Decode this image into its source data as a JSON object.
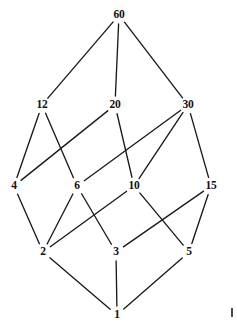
{
  "diagram": {
    "kind": "hasse-diagram",
    "background_color": "#ffffff",
    "line_color": "#1a1a1a",
    "label_color": "#111111",
    "nodes": [
      {
        "id": "n60",
        "label": "60",
        "x": 119,
        "y": 15,
        "rank": 0
      },
      {
        "id": "n12",
        "label": "12",
        "x": 42,
        "y": 105,
        "rank": 1
      },
      {
        "id": "n20",
        "label": "20",
        "x": 115,
        "y": 105,
        "rank": 1
      },
      {
        "id": "n30",
        "label": "30",
        "x": 188,
        "y": 105,
        "rank": 1
      },
      {
        "id": "n4",
        "label": "4",
        "x": 14,
        "y": 186,
        "rank": 2
      },
      {
        "id": "n6",
        "label": "6",
        "x": 77,
        "y": 186,
        "rank": 2
      },
      {
        "id": "n10",
        "label": "10",
        "x": 134,
        "y": 186,
        "rank": 2
      },
      {
        "id": "n15",
        "label": "15",
        "x": 211,
        "y": 186,
        "rank": 2
      },
      {
        "id": "n2",
        "label": "2",
        "x": 43,
        "y": 252,
        "rank": 3
      },
      {
        "id": "n3",
        "label": "3",
        "x": 116,
        "y": 252,
        "rank": 3
      },
      {
        "id": "n5",
        "label": "5",
        "x": 189,
        "y": 252,
        "rank": 3
      },
      {
        "id": "n1",
        "label": "1",
        "x": 117,
        "y": 315,
        "rank": 4
      }
    ],
    "edges": [
      {
        "from": "n60",
        "to": "n12"
      },
      {
        "from": "n60",
        "to": "n20"
      },
      {
        "from": "n60",
        "to": "n30"
      },
      {
        "from": "n12",
        "to": "n4"
      },
      {
        "from": "n12",
        "to": "n6"
      },
      {
        "from": "n20",
        "to": "n4"
      },
      {
        "from": "n20",
        "to": "n10"
      },
      {
        "from": "n30",
        "to": "n6"
      },
      {
        "from": "n30",
        "to": "n10"
      },
      {
        "from": "n30",
        "to": "n15"
      },
      {
        "from": "n4",
        "to": "n2"
      },
      {
        "from": "n6",
        "to": "n2"
      },
      {
        "from": "n6",
        "to": "n3"
      },
      {
        "from": "n10",
        "to": "n2"
      },
      {
        "from": "n10",
        "to": "n5"
      },
      {
        "from": "n15",
        "to": "n3"
      },
      {
        "from": "n15",
        "to": "n5"
      },
      {
        "from": "n2",
        "to": "n1"
      },
      {
        "from": "n3",
        "to": "n1"
      },
      {
        "from": "n5",
        "to": "n1"
      }
    ]
  },
  "chart_data": {
    "type": "diagram",
    "nodes": [
      "60",
      "12",
      "20",
      "30",
      "4",
      "6",
      "10",
      "15",
      "2",
      "3",
      "5",
      "1"
    ],
    "levels": [
      [
        "60"
      ],
      [
        "12",
        "20",
        "30"
      ],
      [
        "4",
        "6",
        "10",
        "15"
      ],
      [
        "2",
        "3",
        "5"
      ],
      [
        "1"
      ]
    ],
    "edges": [
      [
        "60",
        "12"
      ],
      [
        "60",
        "20"
      ],
      [
        "60",
        "30"
      ],
      [
        "12",
        "4"
      ],
      [
        "12",
        "6"
      ],
      [
        "20",
        "4"
      ],
      [
        "20",
        "10"
      ],
      [
        "30",
        "6"
      ],
      [
        "30",
        "10"
      ],
      [
        "30",
        "15"
      ],
      [
        "4",
        "2"
      ],
      [
        "6",
        "2"
      ],
      [
        "6",
        "3"
      ],
      [
        "10",
        "2"
      ],
      [
        "10",
        "5"
      ],
      [
        "15",
        "3"
      ],
      [
        "15",
        "5"
      ],
      [
        "2",
        "1"
      ],
      [
        "3",
        "1"
      ],
      [
        "5",
        "1"
      ]
    ],
    "grid": false,
    "legend": "none"
  }
}
